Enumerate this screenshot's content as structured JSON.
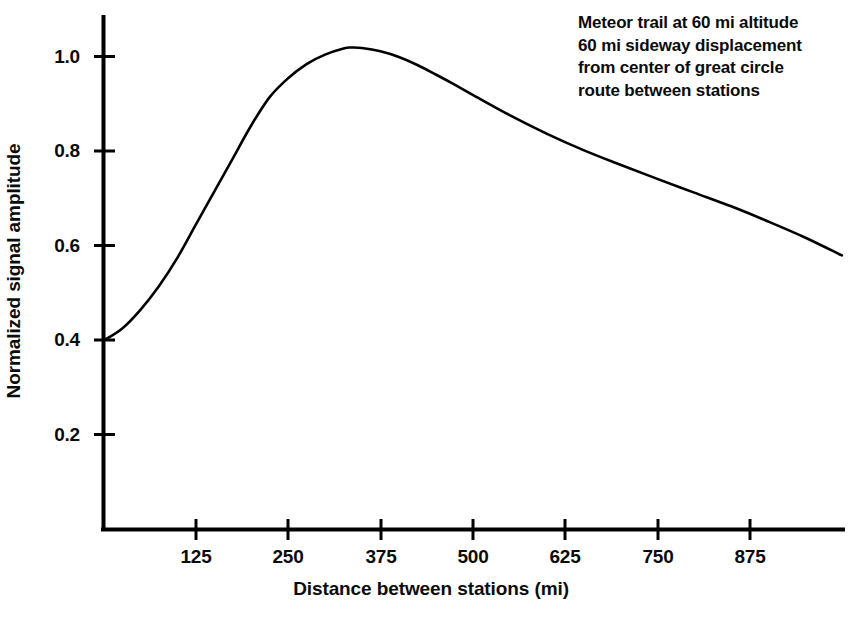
{
  "chart_data": {
    "type": "line",
    "title": "",
    "subtitle": "",
    "xlabel": "Distance between stations (mi)",
    "ylabel": "Normalized signal amplitude",
    "xlim": [
      0,
      1000
    ],
    "ylim": [
      0,
      1.1
    ],
    "xticks": [
      125,
      250,
      375,
      500,
      625,
      750,
      875
    ],
    "xtick_labels": [
      "125",
      "250",
      "375",
      "500",
      "625",
      "750",
      "875"
    ],
    "yticks": [
      0.2,
      0.4,
      0.6,
      0.8,
      1.0
    ],
    "ytick_labels": [
      "0.2",
      "0.4",
      "0.6",
      "0.8",
      "1.0"
    ],
    "grid": false,
    "legend": null,
    "line_color": "#000000",
    "series": [
      {
        "name": "Normalized signal amplitude",
        "x": [
          0,
          25,
          50,
          75,
          100,
          125,
          150,
          175,
          200,
          225,
          250,
          275,
          300,
          325,
          336,
          350,
          375,
          400,
          425,
          450,
          475,
          500,
          550,
          600,
          650,
          700,
          750,
          800,
          850,
          900,
          950,
          1000
        ],
        "y": [
          0.4,
          0.425,
          0.465,
          0.515,
          0.575,
          0.645,
          0.715,
          0.785,
          0.855,
          0.915,
          0.955,
          0.985,
          1.005,
          1.018,
          1.02,
          1.019,
          1.012,
          1.0,
          0.983,
          0.963,
          0.942,
          0.92,
          0.877,
          0.838,
          0.803,
          0.772,
          0.742,
          0.713,
          0.684,
          0.652,
          0.618,
          0.58
        ]
      }
    ],
    "annotation": {
      "lines": [
        "Meteor trail at 60 mi altitude",
        "60 mi sideway displacement",
        "from center of great circle",
        "route between stations"
      ]
    },
    "peak": {
      "x": 336,
      "y": 1.02
    },
    "start": {
      "x": 0,
      "y": 0.4
    },
    "end": {
      "x": 1000,
      "y": 0.58
    }
  }
}
